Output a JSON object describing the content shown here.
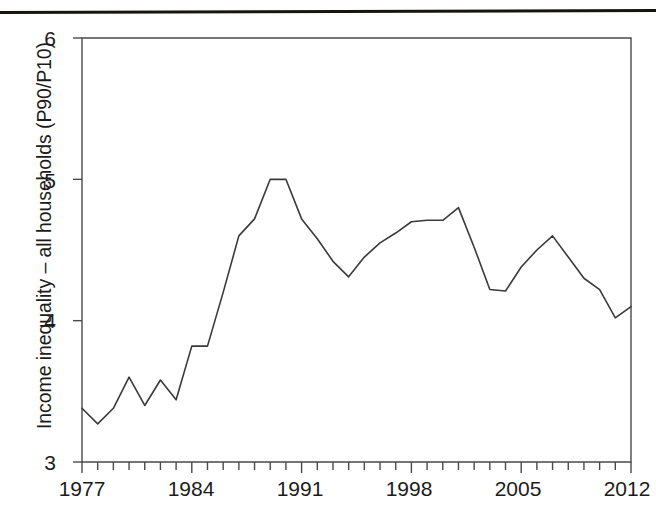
{
  "figure": {
    "background_color": "#ffffff",
    "line_color": "#3a3a3a",
    "axis_color": "#4a4a4a",
    "rule_color": "#15140f"
  },
  "axes": {
    "y_label": "Income inequality – all households (P90/P10)",
    "y_ticks": [
      "6",
      "5",
      "4",
      "3"
    ],
    "x_ticks": [
      "1977",
      "1984",
      "1991",
      "1998",
      "2005",
      "2012"
    ]
  },
  "chart_data": {
    "type": "line",
    "title": "",
    "xlabel": "",
    "ylabel": "Income inequality – all households (P90/P10)",
    "xlim": [
      1977,
      2012
    ],
    "ylim": [
      3,
      6
    ],
    "grid": false,
    "legend": "none",
    "x_tick_values": [
      1977,
      1984,
      1991,
      1998,
      2005,
      2012
    ],
    "x_minor_tick_interval": 1,
    "y_tick_values": [
      3,
      4,
      5,
      6
    ],
    "x": [
      1977,
      1978,
      1979,
      1980,
      1981,
      1982,
      1983,
      1984,
      1985,
      1986,
      1987,
      1988,
      1989,
      1990,
      1991,
      1992,
      1993,
      1994,
      1995,
      1996,
      1997,
      1998,
      1999,
      2000,
      2001,
      2002,
      2003,
      2004,
      2005,
      2006,
      2007,
      2008,
      2009,
      2010,
      2011,
      2012
    ],
    "values": [
      3.38,
      3.27,
      3.38,
      3.6,
      3.4,
      3.58,
      3.44,
      3.82,
      3.82,
      4.2,
      4.6,
      4.72,
      5.0,
      5.0,
      4.72,
      4.58,
      4.42,
      4.31,
      4.45,
      4.55,
      4.62,
      4.7,
      4.71,
      4.71,
      4.8,
      4.52,
      4.22,
      4.21,
      4.38,
      4.5,
      4.6,
      4.45,
      4.3,
      4.22,
      4.02,
      4.1
    ],
    "series": [
      {
        "name": "Income inequality – all households (P90/P10)",
        "values": [
          3.38,
          3.27,
          3.38,
          3.6,
          3.4,
          3.58,
          3.44,
          3.82,
          3.82,
          4.2,
          4.6,
          4.72,
          5.0,
          5.0,
          4.72,
          4.58,
          4.42,
          4.31,
          4.45,
          4.55,
          4.62,
          4.7,
          4.71,
          4.71,
          4.8,
          4.52,
          4.22,
          4.21,
          4.38,
          4.5,
          4.6,
          4.45,
          4.3,
          4.22,
          4.02,
          4.1
        ]
      }
    ]
  }
}
